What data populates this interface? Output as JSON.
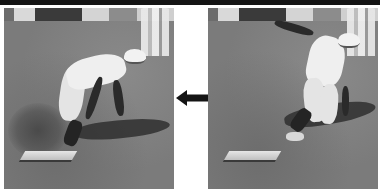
{
  "figure": {
    "panels": [
      {
        "position": "left",
        "subject": "player-reaching-for-base",
        "alt": "Player bent forward reaching down to touch the base, dust kicked up"
      },
      {
        "position": "right",
        "subject": "player-sliding-into-base",
        "alt": "Player sliding on one knee with arm raised, base in foreground"
      }
    ],
    "arrow": {
      "direction": "left",
      "icon": "arrow-left-icon"
    },
    "colors": {
      "top_bar": "#141414",
      "ground": "#7b7b7b",
      "arrow": "#141414",
      "background": "#ffffff"
    }
  }
}
